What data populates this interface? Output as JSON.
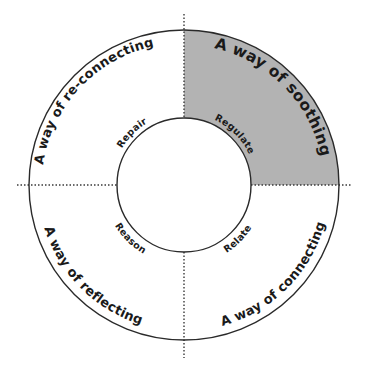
{
  "diagram": {
    "title": "",
    "colors": {
      "highlight_fill": "#b3b3b3",
      "stroke": "#2a2a2a",
      "text": "#1a1a1a",
      "divider": "#3a3a3a"
    },
    "quadrants": [
      {
        "id": "top-left",
        "outer_label": "A way of re-connecting",
        "inner_label": "Repair",
        "highlighted": false
      },
      {
        "id": "top-right",
        "outer_label": "A way of soothing",
        "inner_label": "Regulate",
        "highlighted": true
      },
      {
        "id": "bottom-right",
        "outer_label": "A way of connecting",
        "inner_label": "Relate",
        "highlighted": false
      },
      {
        "id": "bottom-left",
        "outer_label": "A way of reflecting",
        "inner_label": "Reason",
        "highlighted": false
      }
    ]
  }
}
